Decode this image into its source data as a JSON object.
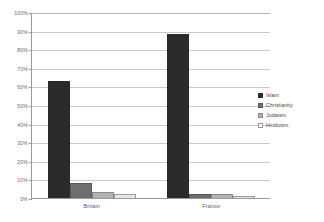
{
  "chart_data": {
    "type": "bar",
    "title": "",
    "subtitle": "",
    "xlabel": "",
    "ylabel": "",
    "categories": [
      "Britain",
      "France"
    ],
    "series": [
      {
        "name": "Islam",
        "values": [
          63,
          88
        ],
        "color": "#2b2b2b"
      },
      {
        "name": "Christianity",
        "values": [
          8,
          2
        ],
        "color": "#6e6e6e"
      },
      {
        "name": "Judaism",
        "values": [
          3,
          2
        ],
        "color": "#b3b3b3"
      },
      {
        "name": "Hinduism",
        "values": [
          2,
          1
        ],
        "color": "#e6e6e6"
      }
    ],
    "ylim": [
      0,
      100
    ],
    "ytick_labels": [
      "0%",
      "10%",
      "20%",
      "30%",
      "40%",
      "50%",
      "60%",
      "70%",
      "80%",
      "90%",
      "100%"
    ],
    "ytick_values": [
      0,
      10,
      20,
      30,
      40,
      50,
      60,
      70,
      80,
      90,
      100
    ],
    "grid": true,
    "legend_position": "right",
    "axis_color": "#9a9a9a",
    "grid_color": "#c9c9c9",
    "background": "#ffffff"
  }
}
